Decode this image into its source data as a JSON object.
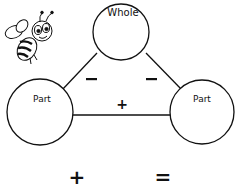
{
  "diagram": {
    "whole_label": "Whole",
    "part_left_label": "Part",
    "part_right_label": "Part",
    "minus_left": "−",
    "minus_right": "−",
    "plus_middle": "+",
    "equation_plus": "+",
    "equation_equals": "=",
    "icon": "bee-icon",
    "stroke_color": "#111111"
  }
}
